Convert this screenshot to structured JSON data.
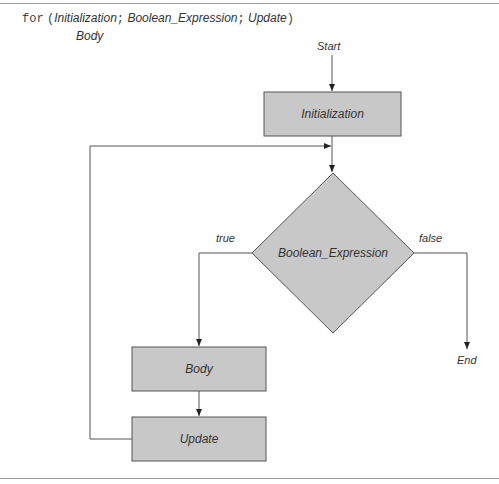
{
  "syntax": {
    "keyword": "for",
    "open_paren": "(",
    "initialization": "Initialization",
    "sep1": ";",
    "boolean_expression": "Boolean_Expression",
    "sep2": ";",
    "update": "Update",
    "close_paren": ")",
    "body": "Body"
  },
  "flowchart": {
    "start_label": "Start",
    "end_label": "End",
    "nodes": {
      "initialization": "Initialization",
      "condition": "Boolean_Expression",
      "body": "Body",
      "update": "Update"
    },
    "edge_labels": {
      "true": "true",
      "false": "false"
    }
  },
  "colors": {
    "box_fill": "#c8c8c8",
    "box_stroke": "#555555",
    "line": "#555555",
    "text": "#333333"
  }
}
